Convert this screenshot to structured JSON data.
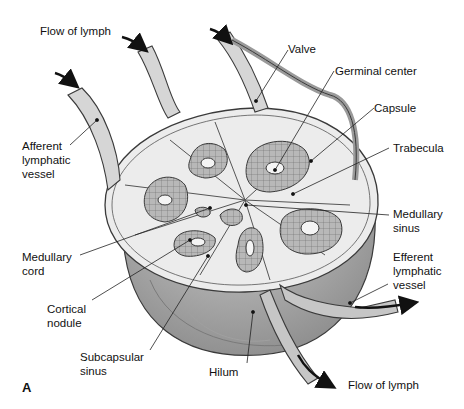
{
  "figure": {
    "panel_letter": "A"
  },
  "labels": {
    "flow_in": "Flow of lymph",
    "afferent": "Afferent\nlymphatic\nvessel",
    "valve": "Valve",
    "germinal_center": "Germinal center",
    "capsule": "Capsule",
    "trabecula": "Trabecula",
    "medullary_sinus": "Medullary\nsinus",
    "medullary_cord": "Medullary\ncord",
    "efferent": "Efferent\nlymphatic\nvessel",
    "cortical_nodule": "Cortical\nnodule",
    "subcapsular_sinus": "Subcapsular\nsinus",
    "hilum": "Hilum",
    "flow_out": "Flow of lymph"
  },
  "colors": {
    "outline": "#3a3a3a",
    "capsule_fill": "#9a9a9a",
    "capsule_light": "#c8c8c8",
    "sinus_fill": "#ececec",
    "nodule_fill": "#b5b5b5",
    "germinal_fill": "#f4f4f4",
    "vessel_fill": "#d6d6d6",
    "arrow": "#111111"
  }
}
